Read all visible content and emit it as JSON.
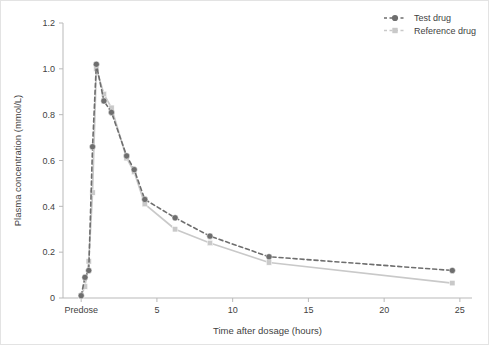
{
  "chart_data": {
    "type": "line",
    "title": "",
    "xlabel": "Time after dosage (hours)",
    "ylabel": "Plasma concentration (mmol/L)",
    "xlim": [
      -1.2,
      25.8
    ],
    "ylim": [
      0,
      1.2
    ],
    "grid": false,
    "legend_position": "top-right",
    "x_tick_values": [
      0,
      5,
      10,
      15,
      20,
      25
    ],
    "x_tick_labels": [
      "Predose",
      "5",
      "10",
      "15",
      "20",
      "25"
    ],
    "y_tick_values": [
      0,
      0.2,
      0.4,
      0.6,
      0.8,
      1.0,
      1.2
    ],
    "y_tick_labels": [
      "0",
      "0.2",
      "0.4",
      "0.6",
      "0.8",
      "1.0",
      "1.2"
    ],
    "series": [
      {
        "name": "Test drug",
        "color": "#6e6e6e",
        "marker": "circle",
        "linestyle": "dashed",
        "x": [
          0,
          0.25,
          0.5,
          0.75,
          1.0,
          1.5,
          2.0,
          3.0,
          3.5,
          4.2,
          6.2,
          8.5,
          12.4,
          24.5
        ],
        "y": [
          0.01,
          0.09,
          0.12,
          0.66,
          1.02,
          0.86,
          0.81,
          0.62,
          0.56,
          0.43,
          0.35,
          0.27,
          0.18,
          0.12
        ]
      },
      {
        "name": "Reference drug",
        "color": "#c9c9c9",
        "marker": "square",
        "linestyle": "dashed",
        "x": [
          0,
          0.25,
          0.5,
          0.75,
          1.0,
          1.5,
          2.0,
          3.0,
          3.5,
          4.2,
          6.2,
          8.5,
          12.4,
          24.5
        ],
        "y": [
          0.01,
          0.05,
          0.16,
          0.46,
          1.0,
          0.89,
          0.83,
          0.61,
          0.55,
          0.41,
          0.3,
          0.24,
          0.155,
          0.065
        ]
      }
    ]
  },
  "legend": {
    "items": [
      {
        "label": "Test drug"
      },
      {
        "label": "Reference drug"
      }
    ]
  },
  "axes": {
    "x_title": "Time after dosage (hours)",
    "y_title": "Plasma concentration (mmol/L)"
  }
}
